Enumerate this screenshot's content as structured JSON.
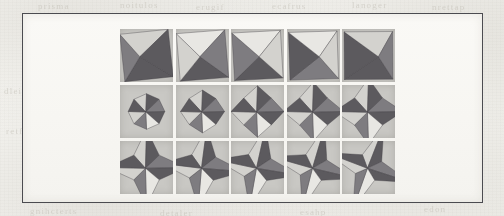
{
  "figure": {
    "kind": "scanned-journal-figure",
    "frame": {
      "border_color": "#4b4b50"
    },
    "paper_color": "#f3f2ee",
    "cell_background": "#c9c8c4",
    "shape_colors": {
      "dark_facet": "#5c5a5e",
      "mid_facet": "#7e7c80",
      "light_facet": "#d3d2ce",
      "highlight_facet": "#e8e7e3",
      "edge": "#3e3d41"
    },
    "grid": {
      "rows": 3,
      "columns": 5,
      "cell_size_px": 53,
      "row_labels": [
        "row-1-cube-like",
        "row-2-octagonal",
        "row-3-four-point-star"
      ],
      "column_labels": [
        "col-1",
        "col-2",
        "col-3",
        "col-4",
        "col-5"
      ]
    },
    "shapes": [
      {
        "id": "r1c1",
        "row": 1,
        "col": 1,
        "name": "square-faceted-solid-1",
        "type": "cube",
        "scale": 0.46,
        "spike": 0.0,
        "rot": 0,
        "tilt": 0
      },
      {
        "id": "r1c2",
        "row": 1,
        "col": 2,
        "name": "square-faceted-solid-2",
        "type": "cube",
        "scale": 0.46,
        "spike": 0.0,
        "rot": 0,
        "tilt": 1
      },
      {
        "id": "r1c3",
        "row": 1,
        "col": 3,
        "name": "square-faceted-solid-3",
        "type": "cube",
        "scale": 0.46,
        "spike": 0.0,
        "rot": 0,
        "tilt": 2
      },
      {
        "id": "r1c4",
        "row": 1,
        "col": 4,
        "name": "square-faceted-solid-4",
        "type": "cube",
        "scale": 0.46,
        "spike": 0.0,
        "rot": 0,
        "tilt": 3
      },
      {
        "id": "r1c5",
        "row": 1,
        "col": 5,
        "name": "square-faceted-solid-5",
        "type": "cube",
        "scale": 0.46,
        "spike": 0.0,
        "rot": 0,
        "tilt": 4
      },
      {
        "id": "r2c1",
        "row": 2,
        "col": 1,
        "name": "octagonal-solid-1",
        "type": "star",
        "scale": 0.34,
        "spike": 0.02,
        "rot": 0,
        "tilt": 0
      },
      {
        "id": "r2c2",
        "row": 2,
        "col": 2,
        "name": "octagonal-solid-2",
        "type": "star",
        "scale": 0.38,
        "spike": 0.1,
        "rot": 0,
        "tilt": 0
      },
      {
        "id": "r2c3",
        "row": 2,
        "col": 3,
        "name": "octagonal-solid-3",
        "type": "star",
        "scale": 0.42,
        "spike": 0.2,
        "rot": 0,
        "tilt": 0
      },
      {
        "id": "r2c4",
        "row": 2,
        "col": 4,
        "name": "octagonal-solid-4",
        "type": "star",
        "scale": 0.45,
        "spike": 0.28,
        "rot": 0,
        "tilt": 0
      },
      {
        "id": "r2c5",
        "row": 2,
        "col": 5,
        "name": "octagonal-solid-5",
        "type": "star",
        "scale": 0.48,
        "spike": 0.36,
        "rot": 0,
        "tilt": 0
      },
      {
        "id": "r3c1",
        "row": 3,
        "col": 1,
        "name": "four-point-star-1",
        "type": "star",
        "scale": 0.5,
        "spike": 0.52,
        "rot": 0,
        "tilt": 0
      },
      {
        "id": "r3c2",
        "row": 3,
        "col": 2,
        "name": "four-point-star-2",
        "type": "star",
        "scale": 0.5,
        "spike": 0.58,
        "rot": 6,
        "tilt": 0
      },
      {
        "id": "r3c3",
        "row": 3,
        "col": 3,
        "name": "four-point-star-3",
        "type": "star",
        "scale": 0.5,
        "spike": 0.63,
        "rot": 11,
        "tilt": 0
      },
      {
        "id": "r3c4",
        "row": 3,
        "col": 4,
        "name": "four-point-star-4",
        "type": "star",
        "scale": 0.5,
        "spike": 0.68,
        "rot": 15,
        "tilt": 0
      },
      {
        "id": "r3c5",
        "row": 3,
        "col": 5,
        "name": "four-point-star-5",
        "type": "star",
        "scale": 0.5,
        "spike": 0.73,
        "rot": 20,
        "tilt": 0
      }
    ]
  },
  "bleed_through": [
    {
      "text": "prisma",
      "x": 38,
      "y": 1,
      "size": "tiny"
    },
    {
      "text": "noitulos",
      "x": 120,
      "y": 0,
      "size": "tiny"
    },
    {
      "text": "erugif",
      "x": 196,
      "y": 2,
      "size": "tiny"
    },
    {
      "text": "ecafrus",
      "x": 272,
      "y": 1,
      "size": "tiny"
    },
    {
      "text": "lanoger",
      "x": 352,
      "y": 0,
      "size": "tiny"
    },
    {
      "text": "nrettap",
      "x": 432,
      "y": 2,
      "size": "tiny"
    },
    {
      "text": "C.2",
      "x": 437,
      "y": 79,
      "size": "big"
    },
    {
      "text": "dleif",
      "x": 4,
      "y": 86,
      "size": "tiny"
    },
    {
      "text": "retfa",
      "x": 6,
      "y": 126,
      "size": "tiny"
    },
    {
      "text": "noitarugifnoc",
      "x": 36,
      "y": 139,
      "size": "tiny"
    },
    {
      "text": "3102",
      "x": 424,
      "y": 135,
      "size": "tiny"
    },
    {
      "text": "yrtemmys",
      "x": 418,
      "y": 118,
      "size": "tiny"
    },
    {
      "text": "gnihcterts",
      "x": 30,
      "y": 206,
      "size": "tiny"
    },
    {
      "text": "detaler",
      "x": 160,
      "y": 208,
      "size": "tiny"
    },
    {
      "text": "esahp",
      "x": 300,
      "y": 207,
      "size": "tiny"
    },
    {
      "text": "edon",
      "x": 424,
      "y": 204,
      "size": "tiny"
    }
  ]
}
